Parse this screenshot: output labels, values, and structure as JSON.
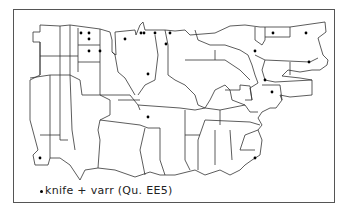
{
  "map": {
    "legend": {
      "symbol": "dot",
      "label": "knife + varr (Qu. EE5)"
    },
    "points": [
      {
        "x": 81,
        "y": 33
      },
      {
        "x": 89,
        "y": 33
      },
      {
        "x": 89,
        "y": 39
      },
      {
        "x": 89,
        "y": 51
      },
      {
        "x": 100,
        "y": 51
      },
      {
        "x": 125,
        "y": 39
      },
      {
        "x": 141,
        "y": 33
      },
      {
        "x": 144,
        "y": 33
      },
      {
        "x": 155,
        "y": 33
      },
      {
        "x": 170,
        "y": 33
      },
      {
        "x": 166,
        "y": 44
      },
      {
        "x": 148,
        "y": 74
      },
      {
        "x": 273,
        "y": 33
      },
      {
        "x": 306,
        "y": 33
      },
      {
        "x": 255,
        "y": 51
      },
      {
        "x": 309,
        "y": 62
      },
      {
        "x": 265,
        "y": 80
      },
      {
        "x": 272,
        "y": 92
      },
      {
        "x": 148,
        "y": 117
      },
      {
        "x": 255,
        "y": 158
      },
      {
        "x": 40,
        "y": 158
      }
    ],
    "colors": {
      "outline": "#333333",
      "dot": "#000000",
      "frame": "#555555"
    }
  }
}
